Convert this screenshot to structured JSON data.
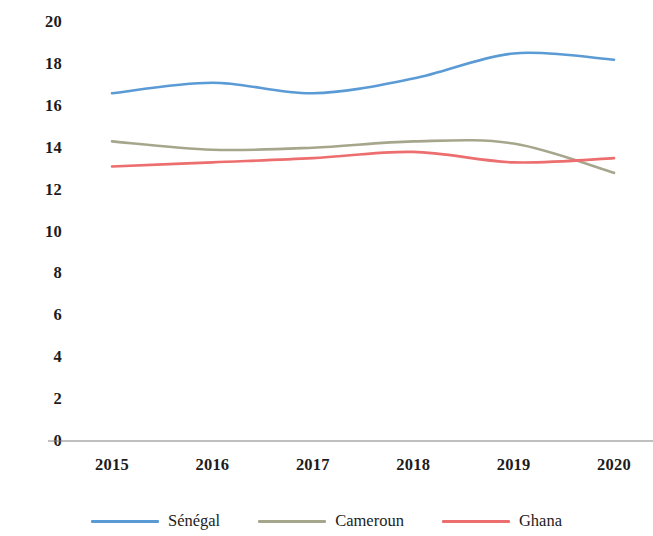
{
  "chart_data": {
    "type": "line",
    "title": "",
    "subtitle": "",
    "xlabel": "",
    "ylabel": "",
    "categories": [
      "2015",
      "2016",
      "2017",
      "2018",
      "2019",
      "2020"
    ],
    "x": [
      2015,
      2016,
      2017,
      2018,
      2019,
      2020
    ],
    "xlim": [
      2015,
      2020
    ],
    "ylim": [
      0,
      20
    ],
    "y_ticks": [
      20,
      18,
      16,
      14,
      12,
      10,
      8,
      6,
      4,
      2,
      0
    ],
    "grid": false,
    "legend_position": "bottom",
    "smoothing": "spline",
    "series": [
      {
        "name": "Sénégal",
        "color": "#5B9BD5",
        "values": [
          16.6,
          17.1,
          16.6,
          17.3,
          18.5,
          18.2
        ]
      },
      {
        "name": "Cameroun",
        "color": "#A6A68C",
        "values": [
          14.3,
          13.9,
          14.0,
          14.3,
          14.2,
          12.8
        ]
      },
      {
        "name": "Ghana",
        "color": "#ED6E6E",
        "values": [
          13.1,
          13.3,
          13.5,
          13.8,
          13.3,
          13.5
        ]
      }
    ]
  },
  "axis": {
    "baseline_color": "#808080",
    "y_tick_labels": [
      "20",
      "18",
      "16",
      "14",
      "12",
      "10",
      "8",
      "6",
      "4",
      "2",
      "0"
    ],
    "x_tick_labels": [
      "2015",
      "2016",
      "2017",
      "2018",
      "2019",
      "2020"
    ]
  },
  "legend": {
    "items": [
      {
        "label": "Sénégal",
        "color": "#5B9BD5"
      },
      {
        "label": "Cameroun",
        "color": "#A6A68C"
      },
      {
        "label": "Ghana",
        "color": "#ED6E6E"
      }
    ]
  }
}
